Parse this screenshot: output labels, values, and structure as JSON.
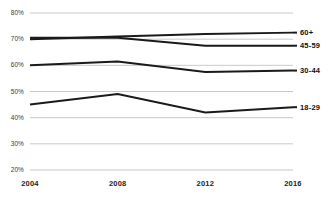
{
  "chart_data": {
    "type": "line",
    "title": "",
    "subtitle": "",
    "xlabel": "",
    "ylabel": "",
    "x": [
      2004,
      2008,
      2012,
      2016
    ],
    "categories": [
      "2004",
      "2008",
      "2012",
      "2016"
    ],
    "xlim": [
      2004,
      2016
    ],
    "ylim": [
      20,
      80
    ],
    "yticks": [
      20,
      30,
      40,
      50,
      60,
      70,
      80
    ],
    "ytick_labels": [
      "20%",
      "30%",
      "40%",
      "50%",
      "60%",
      "70%",
      "80%"
    ],
    "xtick_labels": [
      "2004",
      "2008",
      "2012",
      "2016"
    ],
    "grid": true,
    "grid_axis": "y",
    "grid_color": "#c9c9c9",
    "legend_position": "right-of-line-end",
    "line_color": "#1a1a1a",
    "series": [
      {
        "name": "60+",
        "label": "60+",
        "values": [
          70.0,
          71.0,
          72.0,
          72.5
        ],
        "color": "#1a1a1a"
      },
      {
        "name": "45-59",
        "label": "45-59",
        "values": [
          70.5,
          70.5,
          67.5,
          67.5
        ],
        "color": "#1a1a1a"
      },
      {
        "name": "30-44",
        "label": "30-44",
        "values": [
          60.0,
          61.5,
          57.5,
          58.0
        ],
        "color": "#1a1a1a"
      },
      {
        "name": "18-29",
        "label": "18-29",
        "values": [
          45.0,
          49.0,
          42.0,
          44.0
        ],
        "color": "#1a1a1a"
      }
    ]
  }
}
